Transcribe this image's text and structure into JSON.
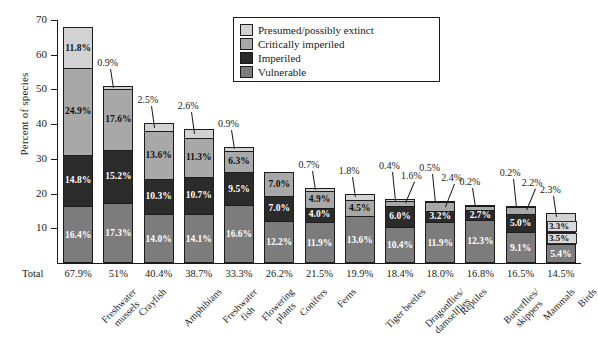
{
  "chart_data": {
    "type": "bar",
    "subtype": "stacked-bar",
    "title": "",
    "xlabel": "",
    "ylabel": "Percent of species",
    "ylim": [
      0,
      70
    ],
    "ytick_values": [
      0,
      10,
      20,
      30,
      40,
      50,
      60,
      70
    ],
    "ytick_labels": [
      "",
      "10",
      "20",
      "30",
      "40",
      "50",
      "60",
      "70"
    ],
    "grid": false,
    "legend_position": "top-center",
    "total_row_label": "Total",
    "categories": [
      "Freshwater mussels",
      "Crayfish",
      "Amphibians",
      "Freshwater fish",
      "Flowering plants",
      "Conifers",
      "Ferns",
      "Tiger beetles",
      "Dragonflies/ damselflies",
      "Reptiles",
      "Butterflies/ skippers",
      "Mammals",
      "Birds"
    ],
    "category_lines": [
      [
        "Freshwater",
        "mussels"
      ],
      [
        "Crayfish"
      ],
      [
        "Amphibians"
      ],
      [
        "Freshwater",
        "fish"
      ],
      [
        "Flowering",
        "plants"
      ],
      [
        "Conifers"
      ],
      [
        "Ferns"
      ],
      [
        "Tiger beetles"
      ],
      [
        "Dragonflies/",
        "damselflies"
      ],
      [
        "Reptiles"
      ],
      [
        "Butterflies/",
        "skippers"
      ],
      [
        "Mammals"
      ],
      [
        "Birds"
      ]
    ],
    "series": [
      {
        "name": "Presumed/possibly extinct",
        "color": "#d2d2d2",
        "values": [
          11.8,
          0.9,
          2.5,
          2.6,
          0.9,
          0.0,
          0.7,
          1.8,
          0.4,
          0.5,
          0.2,
          0.2,
          2.3
        ],
        "labels": [
          "11.8%",
          "0.9%",
          "2.5%",
          "2.6%",
          "0.9%",
          "",
          "0.7%",
          "1.8%",
          "0.4%",
          "0.5%",
          "0.2%",
          "0.2%",
          "2.3%"
        ]
      },
      {
        "name": "Critically imperiled",
        "color": "#a8a8a8",
        "values": [
          24.9,
          17.6,
          13.6,
          11.3,
          6.3,
          7.0,
          4.9,
          4.5,
          1.6,
          2.4,
          1.3,
          2.2,
          3.3
        ],
        "labels": [
          "24.9%",
          "17.6%",
          "13.6%",
          "11.3%",
          "6.3%",
          "7.0%",
          "4.9%",
          "4.5%",
          "1.6%",
          "2.4%",
          "1.3%",
          "2.2%",
          "3.3%"
        ]
      },
      {
        "name": "Imperiled",
        "color": "#2b2b2b",
        "values": [
          14.8,
          15.2,
          10.3,
          10.7,
          9.5,
          7.0,
          4.0,
          0.0,
          6.0,
          3.2,
          2.7,
          5.0,
          3.5
        ],
        "labels": [
          "14.8%",
          "15.2%",
          "10.3%",
          "10.7%",
          "9.5%",
          "7.0%",
          "4.0%",
          "",
          "6.0%",
          "3.2%",
          "2.7%",
          "5.0%",
          "3.5%"
        ]
      },
      {
        "name": "Vulnerable",
        "color": "#7c7c7c",
        "values": [
          16.4,
          17.3,
          14.0,
          14.1,
          16.6,
          12.2,
          11.9,
          13.6,
          10.4,
          11.9,
          12.3,
          9.1,
          5.4
        ],
        "labels": [
          "16.4%",
          "17.3%",
          "14.0%",
          "14.1%",
          "16.6%",
          "12.2%",
          "11.9%",
          "13.6%",
          "10.4%",
          "11.9%",
          "12.3%",
          "9.1%",
          "5.4%"
        ]
      }
    ],
    "totals": [
      "67.9%",
      "51%",
      "40.4%",
      "38.7%",
      "33.3%",
      "26.2%",
      "21.5%",
      "19.9%",
      "18.4%",
      "18.0%",
      "16.8%",
      "16.5%",
      "14.5%"
    ],
    "total_values": [
      67.9,
      51.0,
      40.4,
      38.7,
      33.3,
      26.2,
      21.5,
      19.9,
      18.4,
      18.0,
      16.8,
      16.5,
      14.5
    ]
  },
  "legend": {
    "items": [
      {
        "label": "Presumed/possibly extinct",
        "color": "#d2d2d2"
      },
      {
        "label": "Critically imperiled",
        "color": "#a8a8a8"
      },
      {
        "label": "Imperiled",
        "color": "#2b2b2b"
      },
      {
        "label": "Vulnerable",
        "color": "#7c7c7c"
      }
    ]
  },
  "axis": {
    "y_title": "Percent of species",
    "y_ticks": [
      "70",
      "60",
      "50",
      "40",
      "30",
      "20",
      "10"
    ]
  }
}
